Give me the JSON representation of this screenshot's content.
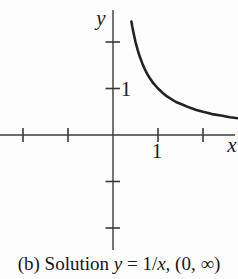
{
  "figure": {
    "background": "#fdfdfd",
    "axis_color": "#3a3a3a",
    "curve_color": "#232323",
    "text_color": "#161616"
  },
  "labels": {
    "y_axis": "y",
    "x_axis": "x",
    "y_tick_1": "1",
    "x_tick_1": "1"
  },
  "caption": {
    "full": "(b) Solution y = 1/x, (0, ∞)",
    "parts": [
      {
        "text": "(b) Solution ",
        "italic": false
      },
      {
        "text": "y",
        "italic": true
      },
      {
        "text": " = 1/",
        "italic": false
      },
      {
        "text": "x",
        "italic": true
      },
      {
        "text": ", (0, ∞)",
        "italic": false
      }
    ]
  },
  "chart_data": {
    "type": "line",
    "title": "",
    "function": "y = 1/x",
    "interval": "(0, ∞)",
    "xlabel": "x",
    "ylabel": "y",
    "x": [
      0.41,
      0.43,
      0.45,
      0.47,
      0.5,
      0.55,
      0.6,
      0.65,
      0.7,
      0.75,
      0.8,
      0.9,
      1.0,
      1.1,
      1.2,
      1.4,
      1.55,
      1.7,
      1.85,
      2.0,
      2.2,
      2.4,
      2.6,
      2.78
    ],
    "y": [
      2.44,
      2.33,
      2.22,
      2.13,
      2.0,
      1.82,
      1.67,
      1.54,
      1.43,
      1.33,
      1.25,
      1.11,
      1.0,
      0.91,
      0.83,
      0.71,
      0.65,
      0.59,
      0.54,
      0.5,
      0.45,
      0.42,
      0.38,
      0.36
    ],
    "x_ticks": [
      -2,
      -1,
      1,
      2
    ],
    "y_ticks": [
      -2,
      -1,
      1,
      2
    ],
    "labeled_x_ticks": [
      1
    ],
    "labeled_y_ticks": [
      1
    ],
    "xlim": [
      -2.51,
      2.78
    ],
    "ylim": [
      -2.47,
      2.69
    ],
    "grid": false,
    "legend": false
  }
}
